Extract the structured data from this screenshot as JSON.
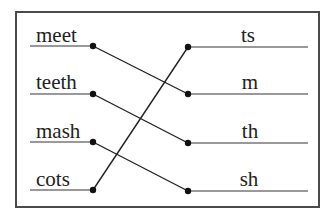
{
  "diagram": {
    "type": "matching-exercise",
    "left_items": [
      {
        "label": "meet",
        "y": 46
      },
      {
        "label": "teeth",
        "y": 94
      },
      {
        "label": "mash",
        "y": 142
      },
      {
        "label": "cots",
        "y": 190
      }
    ],
    "right_items": [
      {
        "label": "ts",
        "y": 47
      },
      {
        "label": "m",
        "y": 94
      },
      {
        "label": "th",
        "y": 143
      },
      {
        "label": "sh",
        "y": 191
      }
    ],
    "connections": [
      {
        "from": "meet",
        "to": "m"
      },
      {
        "from": "teeth",
        "to": "th"
      },
      {
        "from": "mash",
        "to": "sh"
      },
      {
        "from": "cots",
        "to": "ts"
      }
    ],
    "colors": {
      "line": "#222222",
      "underline": "#777777",
      "border": "#4a4a4a"
    }
  }
}
